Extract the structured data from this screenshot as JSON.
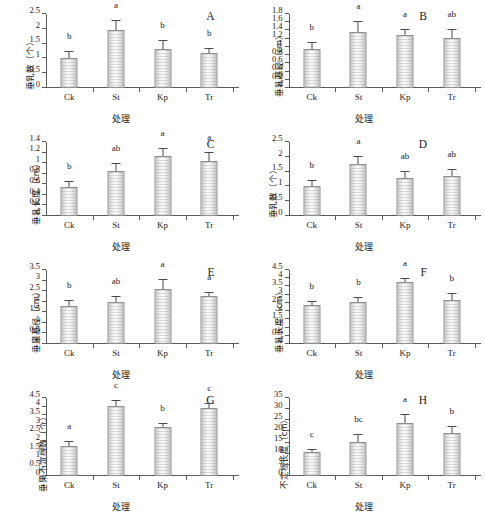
{
  "figure": {
    "xlabel": "处理",
    "categories": [
      "Ck",
      "St",
      "Kp",
      "Tr"
    ],
    "accent_color": "#d9d9d9",
    "axis_color": "#5a5a5a"
  },
  "chart_data": [
    {
      "type": "bar",
      "panel": "A",
      "title": "A",
      "xlabel": "处理",
      "ylabel": "垂乳数（个）",
      "categories": [
        "Ck",
        "St",
        "Kp",
        "Tr"
      ],
      "values": [
        1.03,
        1.95,
        1.32,
        1.18
      ],
      "errors": [
        0.17,
        0.3,
        0.27,
        0.15
      ],
      "sig_letters": [
        "b",
        "a",
        "b",
        "b"
      ],
      "ylim": [
        0,
        2.5
      ],
      "yticks": [
        0,
        0.5,
        1,
        1.5,
        2,
        2.5
      ],
      "ytick_labels": [
        "0",
        "0.5",
        "1",
        "1.5",
        "2",
        "2.5"
      ],
      "grid": false,
      "legend": "none"
    },
    {
      "type": "bar",
      "panel": "B",
      "title": "B",
      "xlabel": "处理",
      "ylabel": "垂乳基径（cm）",
      "categories": [
        "Ck",
        "St",
        "Kp",
        "Tr"
      ],
      "values": [
        0.94,
        1.37,
        1.28,
        1.22
      ],
      "errors": [
        0.16,
        0.23,
        0.13,
        0.2
      ],
      "sig_letters": [
        "b",
        "a",
        "a",
        "ab"
      ],
      "ylim": [
        0,
        1.8
      ],
      "yticks": [
        0,
        0.2,
        0.4,
        0.6,
        0.8,
        1,
        1.2,
        1.4,
        1.6,
        1.8
      ],
      "ytick_labels": [
        "0",
        "0.2",
        "0.4",
        "0.6",
        "0.8",
        "1",
        "1.2",
        "1.4",
        "1.6",
        "1.8"
      ],
      "grid": false,
      "legend": "none"
    },
    {
      "type": "bar",
      "panel": "C",
      "title": "C",
      "xlabel": "处理",
      "ylabel": "垂乳长度（cm）",
      "categories": [
        "Ck",
        "St",
        "Kp",
        "Tr"
      ],
      "values": [
        0.55,
        0.86,
        1.14,
        1.05
      ],
      "errors": [
        0.09,
        0.12,
        0.12,
        0.14
      ],
      "sig_letters": [
        "b",
        "ab",
        "a",
        "a"
      ],
      "ylim": [
        0,
        1.4
      ],
      "yticks": [
        0,
        0.2,
        0.4,
        0.6,
        0.8,
        1,
        1.2,
        1.4
      ],
      "ytick_labels": [
        "0",
        "0.2",
        "0.4",
        "0.6",
        "0.8",
        "1",
        "1.2",
        "1.4"
      ],
      "grid": false,
      "legend": "none"
    },
    {
      "type": "bar",
      "panel": "D",
      "title": "D",
      "xlabel": "处理",
      "ylabel": "垂乳数（个）",
      "categories": [
        "Ck",
        "St",
        "Kp",
        "Tr"
      ],
      "values": [
        1.02,
        1.76,
        1.27,
        1.34
      ],
      "errors": [
        0.17,
        0.23,
        0.21,
        0.22
      ],
      "sig_letters": [
        "b",
        "a",
        "ab",
        "ab"
      ],
      "ylim": [
        0,
        2.5
      ],
      "yticks": [
        0,
        0.5,
        1,
        1.5,
        2,
        2.5
      ],
      "ytick_labels": [
        "0",
        "0.5",
        "1",
        "1.5",
        "2",
        "2.5"
      ],
      "grid": false,
      "legend": "none"
    },
    {
      "type": "bar",
      "panel": "E",
      "title": "E",
      "xlabel": "处理",
      "ylabel": "垂果基径（cm）",
      "categories": [
        "Ck",
        "St",
        "Kp",
        "Tr"
      ],
      "values": [
        1.8,
        2.0,
        2.6,
        2.26
      ],
      "errors": [
        0.23,
        0.23,
        0.45,
        0.16
      ],
      "sig_letters": [
        "b",
        "ab",
        "a",
        "a"
      ],
      "ylim": [
        0,
        3.5
      ],
      "yticks": [
        0,
        0.5,
        1,
        1.5,
        2,
        2.5,
        3,
        3.5
      ],
      "ytick_labels": [
        "0",
        "0.5",
        "1",
        "1.5",
        "2",
        "2.5",
        "3",
        "3.5"
      ],
      "grid": false,
      "legend": "none"
    },
    {
      "type": "bar",
      "panel": "F",
      "title": "F",
      "xlabel": "处理",
      "ylabel": "垂乳长度（cm）",
      "categories": [
        "Ck",
        "St",
        "Kp",
        "Tr"
      ],
      "values": [
        2.4,
        2.56,
        3.8,
        2.7
      ],
      "errors": [
        0.14,
        0.25,
        0.17,
        0.35
      ],
      "sig_letters": [
        "b",
        "b",
        "a",
        "b"
      ],
      "ylim": [
        0,
        4.5
      ],
      "yticks": [
        0,
        0.5,
        1,
        1.5,
        2,
        2.5,
        3,
        3.5,
        4,
        4.5
      ],
      "ytick_labels": [
        "0",
        "0.5",
        "1",
        "1.5",
        "2",
        "2.5",
        "3",
        "3.5",
        "4",
        "4.5"
      ],
      "grid": false,
      "legend": "none"
    },
    {
      "type": "bar",
      "panel": "G",
      "title": "G",
      "xlabel": "处理",
      "ylabel": "垂果不定根数（个）",
      "categories": [
        "Ck",
        "St",
        "Kp",
        "Tr"
      ],
      "values": [
        1.75,
        4.05,
        2.8,
        3.9
      ],
      "errors": [
        0.22,
        0.25,
        0.2,
        0.28
      ],
      "sig_letters": [
        "a",
        "c",
        "b",
        "c"
      ],
      "ylim": [
        0,
        4.5
      ],
      "yticks": [
        0,
        0.5,
        1,
        1.5,
        2,
        2.5,
        3,
        3.5,
        4,
        4.5
      ],
      "ytick_labels": [
        "0",
        "0.5",
        "1",
        "1.5",
        "2",
        "2.5",
        "3",
        "3.5",
        "4",
        "4.5"
      ],
      "grid": false,
      "legend": "none"
    },
    {
      "type": "bar",
      "panel": "H",
      "title": "H",
      "xlabel": "处理",
      "ylabel": "不定根长度（cm）",
      "categories": [
        "Ck",
        "St",
        "Kp",
        "Tr"
      ],
      "values": [
        10.7,
        15.2,
        24.0,
        19.5
      ],
      "errors": [
        0.8,
        3.3,
        3.3,
        2.3
      ],
      "sig_letters": [
        "c",
        "bc",
        "a",
        "b"
      ],
      "ylim": [
        0,
        35
      ],
      "yticks": [
        0,
        5,
        10,
        15,
        20,
        25,
        30,
        35
      ],
      "ytick_labels": [
        "0",
        "5",
        "10",
        "15",
        "20",
        "25",
        "30",
        "35"
      ],
      "grid": false,
      "legend": "none"
    }
  ]
}
